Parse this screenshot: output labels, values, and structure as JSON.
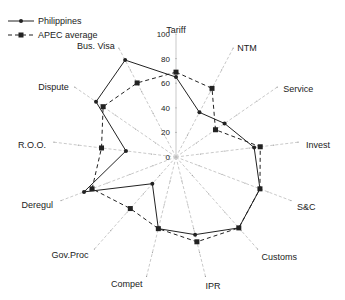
{
  "chart_data": {
    "type": "radar",
    "title": "",
    "categories": [
      "Tariff",
      "NTM",
      "Service",
      "Invest",
      "S&C",
      "Customs",
      "IPR",
      "Compet",
      "Gov.Proc",
      "Deregul",
      "R.O.O.",
      "Dispute",
      "Bus. Visa"
    ],
    "series": [
      {
        "name": "Philippines",
        "style": "solid",
        "marker": "dot",
        "values": [
          65,
          41,
          48,
          64,
          73,
          77,
          65,
          60,
          29,
          80,
          41,
          79,
          89
        ]
      },
      {
        "name": "APEC average",
        "style": "dashed",
        "marker": "square",
        "values": [
          69,
          63,
          39,
          69,
          73,
          77,
          71,
          60,
          56,
          73,
          61,
          72,
          68
        ]
      }
    ],
    "radial_ticks": [
      "0",
      "20",
      "40",
      "60",
      "80",
      "100"
    ],
    "rlim": [
      0,
      100
    ],
    "legend_position": "top-left",
    "colors": {
      "line": "#222222",
      "axis": "#bbbbbb"
    }
  },
  "legend": {
    "items": [
      {
        "label": "Philippines"
      },
      {
        "label": "APEC average"
      }
    ]
  }
}
